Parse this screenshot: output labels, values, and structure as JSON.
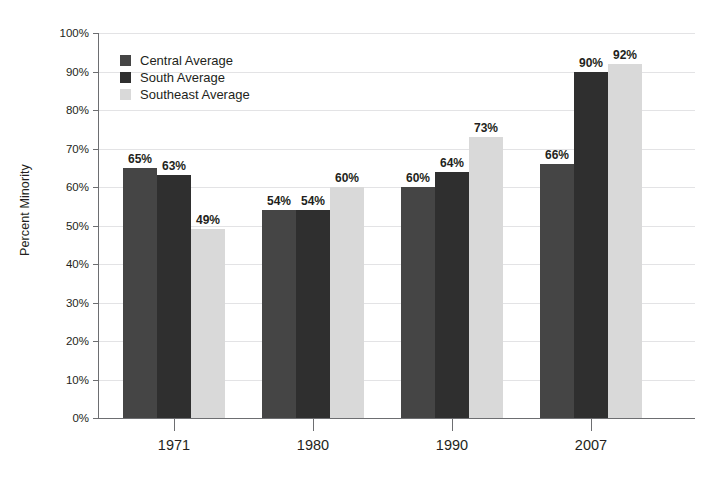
{
  "chart_data": {
    "type": "bar",
    "title": "",
    "subtitle": "",
    "xlabel": "",
    "ylabel": "Percent Minority",
    "categories": [
      "1971",
      "1980",
      "1990",
      "2007"
    ],
    "series": [
      {
        "name": "Central Average",
        "color": "#454545",
        "values": [
          65,
          54,
          60,
          66
        ],
        "labels": [
          "65%",
          "54%",
          "60%",
          "66%"
        ]
      },
      {
        "name": "South Average",
        "color": "#2f2f2f",
        "values": [
          63,
          54,
          64,
          90
        ],
        "labels": [
          "63%",
          "54%",
          "64%",
          "90%"
        ]
      },
      {
        "name": "Southeast Average",
        "color": "#d9d9d9",
        "values": [
          49,
          60,
          73,
          92
        ],
        "labels": [
          "49%",
          "60%",
          "73%",
          "92%"
        ]
      }
    ],
    "ylim": [
      0,
      100
    ],
    "y_tick_step": 10,
    "y_tick_labels": [
      "0%",
      "10%",
      "20%",
      "30%",
      "40%",
      "50%",
      "60%",
      "70%",
      "80%",
      "90%",
      "100%"
    ],
    "grid": true,
    "grid_axis": "y",
    "legend_position": "top-left-inside",
    "value_labels_shown": true,
    "axis_color": "#6d6e71",
    "grid_color": "#e3e3e5",
    "background_color": "#ffffff",
    "text_color": "#231f20"
  }
}
